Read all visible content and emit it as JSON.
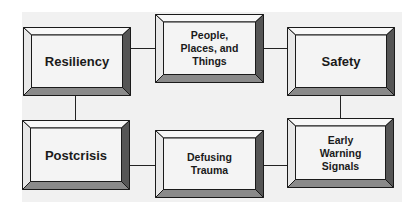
{
  "diagram": {
    "background_color": "#f1f1f1",
    "face_color": "#f4f4f4",
    "top_bevel_color": "#f8f8f8",
    "left_bevel_color": "#e8e8e8",
    "right_bevel_color": "#555555",
    "bottom_bevel_color": "#8a8a8a",
    "nodes": [
      {
        "id": "resiliency",
        "label": "Resiliency",
        "x": 23,
        "y": 27,
        "w": 108,
        "h": 69,
        "size": "lg"
      },
      {
        "id": "people",
        "label": "People,\nPlaces, and\nThings",
        "x": 155,
        "y": 14,
        "w": 109,
        "h": 69,
        "size": "sm"
      },
      {
        "id": "safety",
        "label": "Safety",
        "x": 287,
        "y": 27,
        "w": 108,
        "h": 69,
        "size": "lg"
      },
      {
        "id": "postcrisis",
        "label": "Postcrisis",
        "x": 22,
        "y": 120,
        "w": 108,
        "h": 70,
        "size": "lg"
      },
      {
        "id": "defusing",
        "label": "Defusing\nTrauma",
        "x": 155,
        "y": 130,
        "w": 109,
        "h": 68,
        "size": "sm"
      },
      {
        "id": "early-warning",
        "label": "Early\nWarning\nSignals",
        "x": 287,
        "y": 118,
        "w": 107,
        "h": 70,
        "size": "sm"
      }
    ],
    "edges": [
      {
        "from": "resiliency",
        "to": "people"
      },
      {
        "from": "people",
        "to": "safety"
      },
      {
        "from": "resiliency",
        "to": "postcrisis"
      },
      {
        "from": "safety",
        "to": "early-warning"
      },
      {
        "from": "postcrisis",
        "to": "defusing"
      },
      {
        "from": "defusing",
        "to": "early-warning"
      }
    ]
  }
}
